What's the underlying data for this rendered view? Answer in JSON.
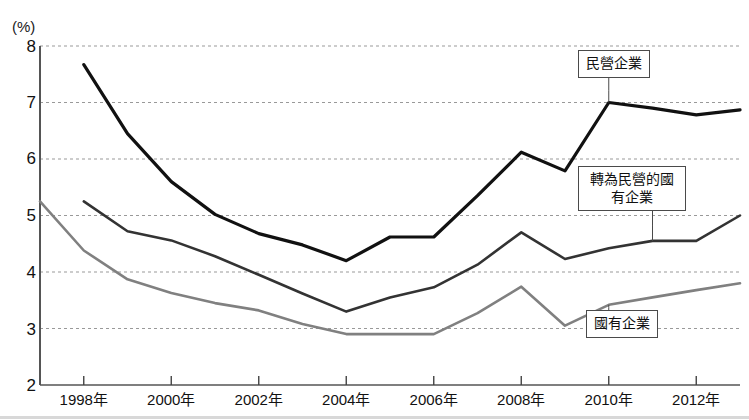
{
  "chart_data": {
    "type": "line",
    "title": "",
    "subtitle": "",
    "xlabel": "",
    "ylabel": "(%)",
    "unit_label": "(%)",
    "grid": true,
    "legend_position": "inline-callouts",
    "xlim": [
      1997,
      2013
    ],
    "ylim": [
      2,
      8
    ],
    "yticks": [
      "8",
      "7",
      "6",
      "5",
      "4",
      "3",
      "2"
    ],
    "ytick_values": [
      8,
      7,
      6,
      5,
      4,
      3,
      2
    ],
    "xticks": [
      "1998年",
      "2000年",
      "2002年",
      "2004年",
      "2006年",
      "2008年",
      "2010年",
      "2012年"
    ],
    "xtick_values": [
      1998,
      2000,
      2002,
      2004,
      2006,
      2008,
      2010,
      2012
    ],
    "x": [
      1997,
      1998,
      1999,
      2000,
      2001,
      2002,
      2003,
      2004,
      2005,
      2006,
      2007,
      2008,
      2009,
      2010,
      2011,
      2012,
      2013
    ],
    "series": [
      {
        "name": "民營企業",
        "color": "#111111",
        "width": 3.2,
        "x": [
          1998,
          1999,
          2000,
          2001,
          2002,
          2003,
          2004,
          2005,
          2006,
          2007,
          2008,
          2009,
          2010,
          2011,
          2012,
          2013
        ],
        "values": [
          7.67,
          6.45,
          5.6,
          5.02,
          4.68,
          4.48,
          4.2,
          4.62,
          4.62,
          5.35,
          6.12,
          5.79,
          7.0,
          6.9,
          6.78,
          6.87
        ]
      },
      {
        "name": "轉為民營的國有企業",
        "color": "#333333",
        "width": 2.6,
        "x": [
          1998,
          1999,
          2000,
          2001,
          2002,
          2003,
          2004,
          2005,
          2006,
          2007,
          2008,
          2009,
          2010,
          2011,
          2012,
          2013
        ],
        "values": [
          5.25,
          4.72,
          4.56,
          4.28,
          3.95,
          3.62,
          3.3,
          3.55,
          3.73,
          4.13,
          4.7,
          4.23,
          4.42,
          4.55,
          4.55,
          5.0
        ]
      },
      {
        "name": "國有企業",
        "color": "#808080",
        "width": 2.6,
        "x": [
          1997,
          1998,
          1999,
          2000,
          2001,
          2002,
          2003,
          2004,
          2005,
          2006,
          2007,
          2008,
          2009,
          2010,
          2011,
          2012,
          2013
        ],
        "values": [
          5.25,
          4.38,
          3.87,
          3.63,
          3.45,
          3.32,
          3.08,
          2.9,
          2.9,
          2.9,
          3.27,
          3.74,
          3.05,
          3.42,
          3.55,
          3.68,
          3.8
        ]
      }
    ],
    "annotations": [
      {
        "label": "民營企業",
        "target_x": 2010,
        "target_y": 7.0
      },
      {
        "label": "轉為民營的國有企業",
        "target_x": 2011,
        "target_y": 4.55
      },
      {
        "label": "國有企業",
        "target_x": 2010,
        "target_y": 3.42
      }
    ]
  },
  "callouts": {
    "private": "民營企業",
    "privatized_soe": "轉為民營的國有企業",
    "soe": "國有企業"
  }
}
